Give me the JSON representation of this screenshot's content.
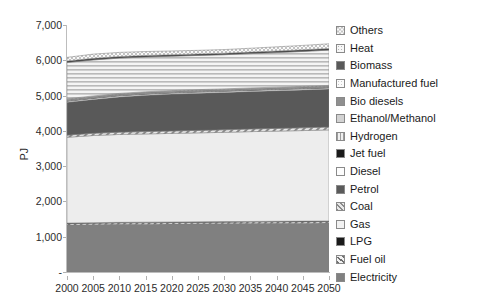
{
  "chart_data": {
    "type": "area",
    "title": "",
    "subtitle": "",
    "xlabel": "",
    "ylabel": "PJ",
    "stacked": true,
    "grid": false,
    "legend_position": "right",
    "x": [
      2000,
      2005,
      2010,
      2015,
      2020,
      2025,
      2030,
      2035,
      2040,
      2045,
      2050
    ],
    "xlim": [
      2000,
      2050
    ],
    "ylim": [
      0,
      7000
    ],
    "x_tick_labels": [
      "2000",
      "2005",
      "2010",
      "2015",
      "2020",
      "2025",
      "2030",
      "2035",
      "2040",
      "2045",
      "2050"
    ],
    "y_tick_labels": [
      "-",
      "1,000",
      "2,000",
      "3,000",
      "4,000",
      "5,000",
      "6,000",
      "7,000"
    ],
    "y_ticks": [
      0,
      1000,
      2000,
      3000,
      4000,
      5000,
      6000,
      7000
    ],
    "stack_order_bottom_to_top": [
      "Electricity",
      "Fuel oil",
      "LPG",
      "Gas",
      "Coal",
      "Petrol",
      "Diesel",
      "Jet fuel",
      "Hydrogen",
      "Ethanol/Methanol",
      "Bio diesels",
      "Manufactured fuel",
      "Biomass",
      "Heat",
      "Others"
    ],
    "series": [
      {
        "name": "Electricity",
        "pattern": "solid-mid-gray",
        "color": "#808080",
        "values": [
          1330,
          1340,
          1350,
          1355,
          1360,
          1365,
          1370,
          1375,
          1380,
          1385,
          1390
        ]
      },
      {
        "name": "Fuel oil",
        "pattern": "diagonal-hatch",
        "color": "#d9d9d9",
        "values": [
          40,
          40,
          40,
          40,
          40,
          40,
          40,
          40,
          40,
          40,
          40
        ]
      },
      {
        "name": "LPG",
        "pattern": "solid-black",
        "color": "#1a1a1a",
        "values": [
          18,
          18,
          18,
          18,
          18,
          18,
          18,
          18,
          18,
          18,
          18
        ]
      },
      {
        "name": "Gas",
        "pattern": "solid-very-light",
        "color": "#ededed",
        "values": [
          2430,
          2470,
          2490,
          2500,
          2510,
          2520,
          2530,
          2545,
          2555,
          2565,
          2580
        ]
      },
      {
        "name": "Coal",
        "pattern": "cross-hatch",
        "color": "#cfcfcf",
        "values": [
          60,
          62,
          64,
          66,
          68,
          70,
          72,
          74,
          76,
          78,
          80
        ]
      },
      {
        "name": "Petrol",
        "pattern": "solid-dark-gray",
        "color": "#595959",
        "values": [
          930,
          960,
          1000,
          1030,
          1045,
          1055,
          1060,
          1065,
          1070,
          1075,
          1080
        ]
      },
      {
        "name": "Diesel",
        "pattern": "solid-white",
        "color": "#fbfbfb",
        "values": [
          30,
          30,
          30,
          30,
          30,
          30,
          30,
          30,
          30,
          30,
          30
        ]
      },
      {
        "name": "Jet fuel",
        "pattern": "solid-black",
        "color": "#1a1a1a",
        "values": [
          10,
          10,
          10,
          10,
          10,
          10,
          10,
          10,
          10,
          10,
          10
        ]
      },
      {
        "name": "Hydrogen",
        "pattern": "vertical-lines",
        "color": "#e0e0e0",
        "values": [
          12,
          12,
          12,
          12,
          12,
          12,
          12,
          12,
          12,
          12,
          12
        ]
      },
      {
        "name": "Ethanol/Methanol",
        "pattern": "light-gray",
        "color": "#d2d2d2",
        "values": [
          14,
          14,
          14,
          14,
          14,
          14,
          14,
          14,
          14,
          14,
          14
        ]
      },
      {
        "name": "Bio diesels",
        "pattern": "mid-gray",
        "color": "#9a9a9a",
        "values": [
          16,
          16,
          16,
          16,
          16,
          16,
          16,
          16,
          16,
          16,
          16
        ]
      },
      {
        "name": "Manufactured fuel",
        "pattern": "dotted",
        "color": "#f0f0f0",
        "values": [
          18,
          18,
          18,
          18,
          18,
          18,
          18,
          18,
          18,
          18,
          18
        ]
      },
      {
        "name": "Biomass",
        "pattern": "horizontal-lines",
        "color": "#e4e4e4",
        "values": [
          1030,
          1020,
          1000,
          985,
          975,
          970,
          968,
          972,
          980,
          990,
          1000
        ]
      },
      {
        "name": "Heat",
        "pattern": "solid-dark",
        "color": "#3d3d3d",
        "values": [
          45,
          45,
          44,
          43,
          42,
          42,
          42,
          43,
          44,
          45,
          46
        ]
      },
      {
        "name": "Others",
        "pattern": "checker",
        "color": "#e8e8e8",
        "values": [
          100,
          120,
          118,
          112,
          106,
          102,
          104,
          110,
          118,
          126,
          134
        ]
      }
    ],
    "totals": [
      6043,
      6109,
      6118,
      6134,
      6150,
      6166,
      6182,
      6217,
      6255,
      6295,
      6340
    ]
  },
  "legend": {
    "items": [
      {
        "label": "Others",
        "swatch": "checker-swatch"
      },
      {
        "label": "Heat",
        "swatch": "dotted-swatch"
      },
      {
        "label": "Biomass",
        "swatch": "dark-solid-swatch"
      },
      {
        "label": "Manufactured fuel",
        "swatch": "light-dotted-swatch"
      },
      {
        "label": "Bio diesels",
        "swatch": "mid-solid-swatch"
      },
      {
        "label": "Ethanol/Methanol",
        "swatch": "light-solid-swatch"
      },
      {
        "label": "Hydrogen",
        "swatch": "vertical-lines-swatch"
      },
      {
        "label": "Jet fuel",
        "swatch": "black-solid-swatch"
      },
      {
        "label": "Diesel",
        "swatch": "white-solid-swatch"
      },
      {
        "label": "Petrol",
        "swatch": "darkgray-solid-swatch"
      },
      {
        "label": "Coal",
        "swatch": "cross-hatch-swatch"
      },
      {
        "label": "Gas",
        "swatch": "verylight-solid-swatch"
      },
      {
        "label": "LPG",
        "swatch": "black-solid-swatch"
      },
      {
        "label": "Fuel oil",
        "swatch": "diagonal-hatch-swatch"
      },
      {
        "label": "Electricity",
        "swatch": "gray-solid-swatch"
      }
    ]
  },
  "colors": {
    "axis": "#bdbdbd",
    "tick_text": "#2b2b2b",
    "legend_text": "#1a1a1a",
    "background": "#ffffff"
  }
}
